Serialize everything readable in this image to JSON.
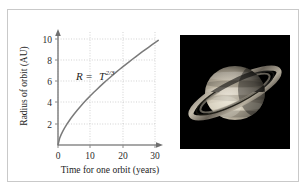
{
  "figure": {
    "background_color": "#ffffff",
    "frame_color": "#c9c9c9"
  },
  "chart_data": {
    "type": "line",
    "title": "",
    "xlabel": "Time for one orbit (years)",
    "ylabel": "Radius of orbit (AU)",
    "annotation": "R = T^2/3",
    "annotation_parts": {
      "variable_r": "R",
      "equals": "=",
      "variable_t": "T",
      "exponent": "2/3"
    },
    "xlim": [
      0,
      32
    ],
    "ylim": [
      0,
      10.5
    ],
    "xticks": [
      0,
      10,
      20,
      30
    ],
    "xtick_labels": [
      "0",
      "10",
      "20",
      "30"
    ],
    "yticks": [
      2,
      4,
      6,
      8,
      10
    ],
    "ytick_labels": [
      "2",
      "4",
      "6",
      "8",
      "10"
    ],
    "grid": true,
    "grid_style": "dotted",
    "grid_color": "#bfbfbf",
    "legend": null,
    "axis_color": "#8a8a8a",
    "curve_color": "#7a7a7a",
    "series": [
      {
        "name": "R = T^(2/3)",
        "x": [
          0,
          0.5,
          1,
          1.5,
          2,
          3,
          4,
          5,
          6,
          7,
          8,
          9,
          10,
          11,
          12,
          13,
          14,
          15,
          16,
          17,
          18,
          19,
          20,
          21,
          22,
          23,
          24,
          25,
          26,
          27,
          28,
          29,
          30,
          31
        ],
        "y": [
          0,
          0.63,
          1.0,
          1.31,
          1.59,
          2.08,
          2.52,
          2.92,
          3.3,
          3.66,
          4.0,
          4.33,
          4.64,
          4.95,
          5.24,
          5.53,
          5.81,
          6.08,
          6.35,
          6.61,
          6.87,
          7.12,
          7.37,
          7.61,
          7.85,
          8.09,
          8.32,
          8.55,
          8.78,
          9.0,
          9.22,
          9.44,
          9.65,
          9.87
        ]
      }
    ]
  },
  "photo": {
    "subject": "saturn-with-rings",
    "background_color": "#000000",
    "planet_color": "#cfc6b4",
    "ring_color": "#b8b0a0"
  }
}
